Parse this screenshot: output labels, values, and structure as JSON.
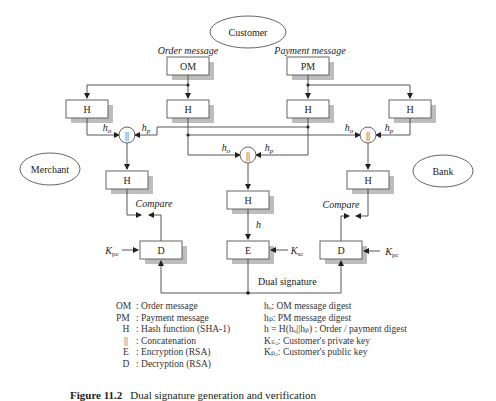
{
  "figure": {
    "caption_number": "Figure 11.2",
    "caption_text": "Dual signature generation and verification"
  },
  "entities": {
    "customer": "Customer",
    "merchant": "Merchant",
    "bank": "Bank"
  },
  "inputs": {
    "order_label": "Order message",
    "payment_label": "Payment message",
    "om": "OM",
    "pm": "PM"
  },
  "blocks": {
    "hash": "H",
    "concat": "||",
    "encrypt": "E",
    "decrypt": "D"
  },
  "labels": {
    "ho": "h",
    "ho_sub": "o",
    "hp": "h",
    "hp_sub": "p",
    "h": "h",
    "compare": "Compare",
    "k": "K",
    "kpc_sub": "pc",
    "ksc_sub": "sc",
    "dual_signature": "Dual signature"
  },
  "legend_left": [
    {
      "key": "OM",
      "desc": ": Order message"
    },
    {
      "key": "PM",
      "desc": ": Payment message"
    },
    {
      "key": "H",
      "desc": ": Hash function (SHA-1)"
    },
    {
      "key": "||",
      "desc": ": Concatenation"
    },
    {
      "key": "E",
      "desc": ": Encryption (RSA)"
    },
    {
      "key": "D",
      "desc": ": Decryption (RSA)"
    }
  ],
  "legend_right": [
    "hₒ: OM message digest",
    "hₚ: PM message digest",
    "h = H(hₒ||hₚ) : Order / payment digest",
    "Kₛ꜀: Customer's private key",
    "Kₚ꜀: Customer's public key"
  ]
}
